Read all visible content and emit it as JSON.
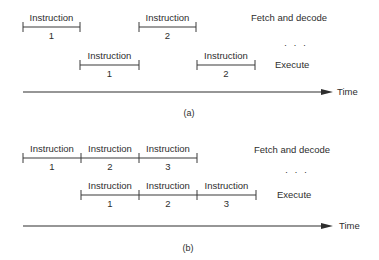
{
  "figure": {
    "panels": [
      {
        "id": "a",
        "caption": "(a)",
        "fetch_label": "Fetch and decode",
        "ellipsis": "· · ·",
        "execute_label": "Execute",
        "time_label": "Time",
        "fetch_row": [
          {
            "label": "Instruction",
            "number": "1",
            "x1": 23,
            "x2": 80
          },
          {
            "label": "Instruction",
            "number": "2",
            "x1": 139,
            "x2": 196
          }
        ],
        "execute_row": [
          {
            "label": "Instruction",
            "number": "1",
            "x1": 80,
            "x2": 139
          },
          {
            "label": "Instruction",
            "number": "2",
            "x1": 197,
            "x2": 255
          }
        ]
      },
      {
        "id": "b",
        "caption": "(b)",
        "fetch_label": "Fetch and decode",
        "ellipsis": "· · ·",
        "execute_label": "Execute",
        "time_label": "Time",
        "fetch_row": [
          {
            "label": "Instruction",
            "number": "1",
            "x1": 23,
            "x2": 81
          },
          {
            "label": "Instruction",
            "number": "2",
            "x1": 81,
            "x2": 139
          },
          {
            "label": "Instruction",
            "number": "3",
            "x1": 139,
            "x2": 197
          }
        ],
        "execute_row": [
          {
            "label": "Instruction",
            "number": "1",
            "x1": 81,
            "x2": 139
          },
          {
            "label": "Instruction",
            "number": "2",
            "x1": 139,
            "x2": 197
          },
          {
            "label": "Instruction",
            "number": "3",
            "x1": 197,
            "x2": 256
          }
        ]
      }
    ]
  }
}
